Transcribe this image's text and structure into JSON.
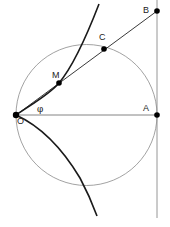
{
  "diagram": {
    "colors": {
      "background": "#ffffff",
      "curve": "#1a1a1a",
      "thin_line": "#888888",
      "point": "#000000",
      "label": "#222222"
    },
    "points": [
      {
        "id": "O",
        "label": "O",
        "x": 16,
        "y": 115
      },
      {
        "id": "A",
        "label": "A",
        "x": 157,
        "y": 115
      },
      {
        "id": "B",
        "label": "B",
        "x": 157,
        "y": 11
      },
      {
        "id": "C",
        "label": "C",
        "x": 104,
        "y": 49
      },
      {
        "id": "M",
        "label": "M",
        "x": 59,
        "y": 83
      }
    ],
    "angle_label": "φ",
    "circle": {
      "cx": 86.5,
      "cy": 115,
      "r": 70.5
    },
    "tangent_line": {
      "x": 157,
      "y1": 0,
      "y2": 218
    },
    "segments": [
      {
        "name": "OA",
        "from": "O",
        "to": "A"
      },
      {
        "name": "OB",
        "from": "O",
        "to": "B"
      }
    ],
    "curve_upper": "M16,115 C32,104 50,94 59,83 C70,70 82,48 99,4",
    "curve_lower": "M16,115 C40,126 62,148 80,178 C88,193 93,205 97,216"
  }
}
